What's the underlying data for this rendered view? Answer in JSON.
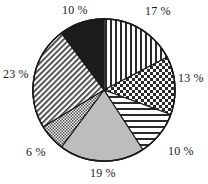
{
  "chart_data": {
    "type": "pie",
    "title": "",
    "subtitle": "",
    "xlabel": "",
    "ylabel": "",
    "legend_position": "none",
    "grid": false,
    "value_suffix": " %",
    "start_angle_deg": 0,
    "direction": "clockwise",
    "categories": [
      "Slice 1",
      "Slice 2",
      "Slice 3",
      "Slice 4",
      "Slice 5",
      "Slice 6",
      "Slice 7"
    ],
    "values": [
      17,
      13,
      10,
      19,
      6,
      23,
      10
    ],
    "labels": [
      "17 %",
      "13 %",
      "10 %",
      "19 %",
      "6 %",
      "23 %",
      "10 %"
    ],
    "slices": [
      {
        "label": "17 %",
        "value": 17,
        "pattern": "vertical-stripes",
        "fill": "#ffffff",
        "stroke": "#1a1a1a",
        "label_x": 145,
        "label_y": 5
      },
      {
        "label": "13 %",
        "value": 13,
        "pattern": "checkerboard",
        "fill": "#ffffff",
        "stroke": "#1a1a1a",
        "label_x": 178,
        "label_y": 72
      },
      {
        "label": "10 %",
        "value": 10,
        "pattern": "horizontal-stripes",
        "fill": "#ffffff",
        "stroke": "#1a1a1a",
        "label_x": 168,
        "label_y": 145
      },
      {
        "label": "19 %",
        "value": 19,
        "pattern": "solid-gray",
        "fill": "#bdbdbd",
        "stroke": "#1a1a1a",
        "label_x": 90,
        "label_y": 167
      },
      {
        "label": "6 %",
        "value": 6,
        "pattern": "fine-crosshatch",
        "fill": "#ffffff",
        "stroke": "#1a1a1a",
        "label_x": 26,
        "label_y": 146
      },
      {
        "label": "23 %",
        "value": 23,
        "pattern": "diagonal-hatch",
        "fill": "#ffffff",
        "stroke": "#1a1a1a",
        "label_x": 3,
        "label_y": 68
      },
      {
        "label": "10 %",
        "value": 10,
        "pattern": "solid-black",
        "fill": "#1c1c1c",
        "stroke": "#1a1a1a",
        "label_x": 62,
        "label_y": 4
      }
    ],
    "colors": {
      "outline": "#1a1a1a",
      "gray_slice": "#bdbdbd",
      "black_slice": "#1c1c1c",
      "background": "#ffffff",
      "label_text": "#1a1a1a"
    },
    "geometry": {
      "center_x": 104,
      "center_y": 90,
      "radius": 71
    }
  }
}
